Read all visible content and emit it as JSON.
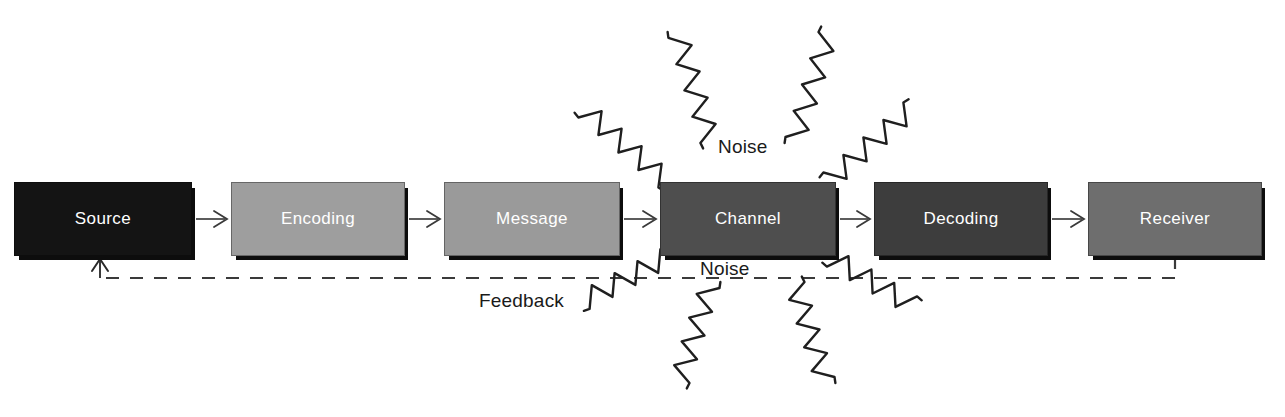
{
  "diagram": {
    "background": "#ffffff",
    "nodes": [
      {
        "id": "source",
        "label": "Source",
        "x": 14,
        "y": 182,
        "w": 178,
        "h": 74,
        "fill": "#141414",
        "text_color": "#ffffff"
      },
      {
        "id": "encoding",
        "label": "Encoding",
        "x": 231,
        "y": 182,
        "w": 174,
        "h": 74,
        "fill": "#9e9e9e",
        "text_color": "#ffffff"
      },
      {
        "id": "message",
        "label": "Message",
        "x": 444,
        "y": 182,
        "w": 176,
        "h": 74,
        "fill": "#9a9a9a",
        "text_color": "#ffffff"
      },
      {
        "id": "channel",
        "label": "Channel",
        "x": 660,
        "y": 182,
        "w": 176,
        "h": 74,
        "fill": "#4e4e4e",
        "text_color": "#ffffff"
      },
      {
        "id": "decoding",
        "label": "Decoding",
        "x": 874,
        "y": 182,
        "w": 174,
        "h": 74,
        "fill": "#3d3d3d",
        "text_color": "#ffffff"
      },
      {
        "id": "receiver",
        "label": "Receiver",
        "x": 1088,
        "y": 182,
        "w": 174,
        "h": 74,
        "fill": "#6e6e6e",
        "text_color": "#ffffff"
      }
    ],
    "flow_arrows": [
      {
        "id": "source-to-encoding",
        "x1": 196,
        "x2": 227,
        "y": 219
      },
      {
        "id": "encoding-to-message",
        "x1": 409,
        "x2": 440,
        "y": 219
      },
      {
        "id": "message-to-channel",
        "x1": 624,
        "x2": 656,
        "y": 219
      },
      {
        "id": "channel-to-decoding",
        "x1": 840,
        "x2": 870,
        "y": 219
      },
      {
        "id": "decoding-to-receiver",
        "x1": 1052,
        "x2": 1084,
        "y": 219
      }
    ],
    "labels": [
      {
        "id": "noise-top",
        "text": "Noise",
        "x": 718,
        "y": 136,
        "size": 19
      },
      {
        "id": "noise-bottom",
        "text": "Noise",
        "x": 700,
        "y": 258,
        "size": 19
      },
      {
        "id": "feedback",
        "text": "Feedback",
        "x": 479,
        "y": 290,
        "size": 19
      }
    ],
    "feedback_path": {
      "id": "feedback-loop",
      "style": "dashed",
      "stroke": "#3a3a3a",
      "dash": "13 11",
      "from_node": "receiver",
      "to_node": "source",
      "y": 278,
      "right_x": 1175,
      "right_y_top": 256,
      "left_x": 100,
      "left_y_top": 259
    },
    "noise_squiggles": [
      {
        "id": "noise-squiggle-top-far-left",
        "x1": 585,
        "y1": 110,
        "x2": 665,
        "y2": 180
      },
      {
        "id": "noise-squiggle-top-left",
        "x1": 678,
        "y1": 35,
        "x2": 710,
        "y2": 140
      },
      {
        "id": "noise-squiggle-top-right",
        "x1": 828,
        "y1": 35,
        "x2": 795,
        "y2": 140
      },
      {
        "id": "noise-squiggle-top-far-right",
        "x1": 910,
        "y1": 110,
        "x2": 830,
        "y2": 180
      },
      {
        "id": "noise-squiggle-bottom-far-left",
        "x1": 585,
        "y1": 300,
        "x2": 665,
        "y2": 258
      },
      {
        "id": "noise-squiggle-bottom-left",
        "x1": 680,
        "y1": 380,
        "x2": 710,
        "y2": 285
      },
      {
        "id": "noise-squiggle-bottom-right",
        "x1": 825,
        "y1": 380,
        "x2": 795,
        "y2": 285
      },
      {
        "id": "noise-squiggle-bottom-far-right",
        "x1": 912,
        "y1": 305,
        "x2": 832,
        "y2": 258
      }
    ]
  }
}
